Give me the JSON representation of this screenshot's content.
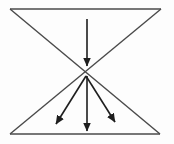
{
  "figure": {
    "canvas": {
      "width": 174,
      "height": 144,
      "background": "#fdfdfd"
    },
    "outline": {
      "color": "#4a4a4a",
      "stroke_width": 1.4,
      "edges": [
        {
          "name": "top-edge",
          "x1": 10,
          "y1": 9,
          "x2": 161,
          "y2": 9
        },
        {
          "name": "bottom-edge",
          "x1": 10,
          "y1": 134,
          "x2": 160,
          "y2": 134
        },
        {
          "name": "diagonal-tl-to-br",
          "x1": 10,
          "y1": 9,
          "x2": 160,
          "y2": 134
        },
        {
          "name": "diagonal-tr-to-bl",
          "x1": 161,
          "y1": 9,
          "x2": 10,
          "y2": 134
        }
      ]
    },
    "arrows": {
      "color": "#1e1e1e",
      "stroke_width": 1.6,
      "head": {
        "length": 9,
        "width": 8
      },
      "lines": [
        {
          "name": "top-inflow-arrow",
          "x1": 87,
          "y1": 19,
          "x2": 87,
          "y2": 66
        },
        {
          "name": "fan-left-arrow",
          "x1": 86,
          "y1": 76,
          "x2": 56,
          "y2": 124
        },
        {
          "name": "fan-middle-arrow",
          "x1": 87,
          "y1": 76,
          "x2": 87,
          "y2": 131
        },
        {
          "name": "fan-right-arrow",
          "x1": 86,
          "y1": 76,
          "x2": 115,
          "y2": 122
        }
      ]
    }
  }
}
